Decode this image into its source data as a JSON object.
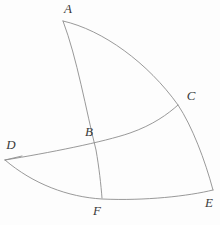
{
  "figure": {
    "canvas": {
      "width": 220,
      "height": 225
    },
    "background_color": "#fdfdfd",
    "stroke_color": "#8d8d8d",
    "label_color": "#3a3a3a",
    "stroke_width": 0.9
  },
  "points": [
    {
      "id": "A",
      "label": "A",
      "x": 63,
      "y": 21,
      "label_x": 68,
      "label_y": 10
    },
    {
      "id": "B",
      "label": "B",
      "x": 104,
      "y": 142,
      "label_x": 89,
      "label_y": 133
    },
    {
      "id": "C",
      "label": "C",
      "x": 178,
      "y": 105,
      "label_x": 191,
      "label_y": 97
    },
    {
      "id": "D",
      "label": "D",
      "x": 5,
      "y": 160,
      "label_x": 11,
      "label_y": 146
    },
    {
      "id": "E",
      "label": "E",
      "x": 213,
      "y": 190,
      "label_x": 209,
      "label_y": 204
    },
    {
      "id": "F",
      "label": "F",
      "x": 102,
      "y": 198,
      "label_x": 97,
      "label_y": 212
    }
  ],
  "curves": [
    {
      "id": "arc-A-C-E",
      "name": "outer-upper-arc",
      "from": "A",
      "through": "C",
      "to": "E",
      "path": "M 63 21 C 103 30 148 63 178 105 C 192 126 205 160 213 190"
    },
    {
      "id": "arc-A-B-F",
      "name": "inner-left-arc",
      "from": "A",
      "through": "B",
      "to": "F",
      "path": "M 63 21 C 77 58 86 110 96 150 C 99 167 101 185 102 198"
    },
    {
      "id": "arc-D-B-C",
      "name": "middle-arc",
      "from": "D",
      "through": "B",
      "to": "C",
      "path": "M 5 160 C 48 153 104 142 130 133 C 153 125 168 114 178 105"
    },
    {
      "id": "arc-D-F-E",
      "name": "outer-lower-arc",
      "from": "D",
      "through": "F",
      "to": "E",
      "path": "M 5 160 C 33 184 68 197 102 199 C 145 201 189 196 213 190"
    },
    {
      "id": "seg-D-notch",
      "name": "left-vertex-notch",
      "from": "D",
      "to": "D",
      "path": "M 5 160 L 22 156"
    }
  ]
}
